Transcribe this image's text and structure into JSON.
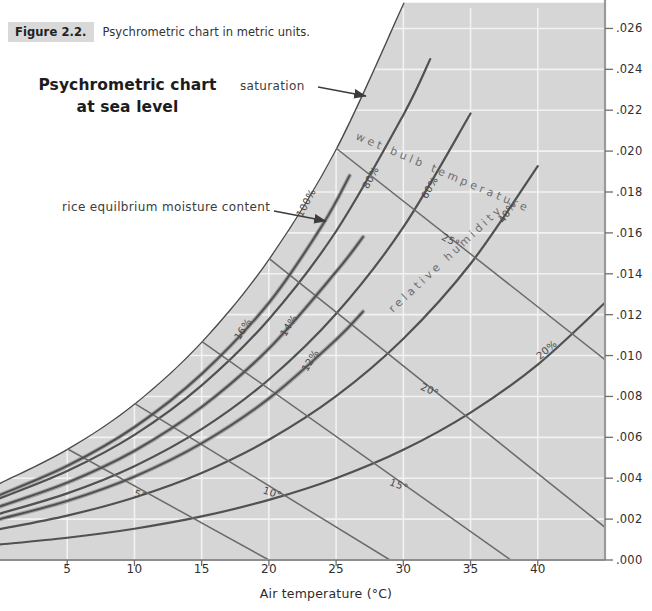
{
  "caption": {
    "tag": "Figure 2.2.",
    "text": "Psychrometric chart in metric units."
  },
  "title": {
    "line1": "Psychrometric chart",
    "line2": "at sea level"
  },
  "annotations": {
    "saturation": "saturation",
    "emc": "rice equilbrium moisture content",
    "wet_bulb_inline": "wet bulb temperature",
    "relative_humidity_inline": "relative humidity"
  },
  "colors": {
    "plot_fill": "#d6d6d6",
    "grid": "#f2f2f2",
    "curve": "#4a4a4a",
    "emc_curve": "#6f6f6f",
    "axis": "#9a9a9a",
    "caption_tag_bg": "#d9d9d9",
    "text": "#3a3a3a"
  },
  "chart_data": {
    "type": "line",
    "title": "Psychrometric chart at sea level",
    "xlabel": "Air temperature (°C)",
    "ylabel": "",
    "xlim": [
      0,
      45
    ],
    "ylim": [
      0.0,
      0.027
    ],
    "grid": true,
    "legend": "none",
    "xticks": [
      5,
      10,
      15,
      20,
      25,
      30,
      35,
      40
    ],
    "xtick_labels": [
      "5",
      "10",
      "15",
      "20",
      "25",
      "30",
      "35",
      "40"
    ],
    "yticks": [
      0.0,
      0.002,
      0.004,
      0.006,
      0.008,
      0.01,
      0.012,
      0.014,
      0.016,
      0.018,
      0.02,
      0.022,
      0.024,
      0.026
    ],
    "ytick_labels": [
      ".000",
      ".002",
      ".004",
      ".006",
      ".008",
      ".010",
      ".012",
      ".014",
      ".016",
      ".018",
      ".020",
      ".022",
      ".024",
      ".026"
    ],
    "series": [
      {
        "name": "100%",
        "kind": "relative-humidity",
        "label": "100%",
        "x": [
          0,
          5,
          10,
          15,
          20,
          25,
          30
        ],
        "values": [
          0.00378,
          0.00544,
          0.00766,
          0.01069,
          0.01475,
          0.02014,
          0.02726
        ]
      },
      {
        "name": "80%",
        "kind": "relative-humidity",
        "label": "80%",
        "x": [
          0,
          5,
          10,
          15,
          20,
          25,
          30,
          32
        ],
        "values": [
          0.00302,
          0.00435,
          0.00612,
          0.00854,
          0.01178,
          0.01608,
          0.02177,
          0.0245
        ]
      },
      {
        "name": "60%",
        "kind": "relative-humidity",
        "label": "60%",
        "x": [
          0,
          5,
          10,
          15,
          20,
          25,
          30,
          35
        ],
        "values": [
          0.00227,
          0.00326,
          0.00459,
          0.0064,
          0.00883,
          0.01204,
          0.01628,
          0.02184
        ]
      },
      {
        "name": "40%",
        "kind": "relative-humidity",
        "label": "40%",
        "x": [
          0,
          5,
          10,
          15,
          20,
          25,
          30,
          35,
          40
        ],
        "values": [
          0.00151,
          0.00217,
          0.00306,
          0.00426,
          0.00588,
          0.00801,
          0.01082,
          0.01449,
          0.01927
        ]
      },
      {
        "name": "20%",
        "kind": "relative-humidity",
        "label": "20%",
        "x": [
          0,
          5,
          10,
          15,
          20,
          25,
          30,
          35,
          40,
          45
        ],
        "values": [
          0.00076,
          0.00109,
          0.00153,
          0.00213,
          0.00294,
          0.004,
          0.00539,
          0.00721,
          0.00956,
          0.01258
        ]
      },
      {
        "name": "5°",
        "kind": "wet-bulb",
        "label": "5°",
        "x": [
          5,
          20
        ],
        "values": [
          0.00544,
          0.0
        ]
      },
      {
        "name": "10°",
        "kind": "wet-bulb",
        "label": "10°",
        "x": [
          10,
          29
        ],
        "values": [
          0.00766,
          0.0
        ]
      },
      {
        "name": "15°",
        "kind": "wet-bulb",
        "label": "15°",
        "x": [
          15,
          38
        ],
        "values": [
          0.01069,
          0.0
        ]
      },
      {
        "name": "20°",
        "kind": "wet-bulb",
        "label": "20°",
        "x": [
          20,
          45
        ],
        "values": [
          0.01475,
          0.0016
        ]
      },
      {
        "name": "25°",
        "kind": "wet-bulb",
        "label": "25°",
        "x": [
          25,
          45
        ],
        "values": [
          0.02014,
          0.0098
        ]
      },
      {
        "name": "16%",
        "kind": "rice-emc",
        "label": "16%",
        "x": [
          0,
          5,
          10,
          15,
          20,
          24,
          26
        ],
        "values": [
          0.00318,
          0.0046,
          0.0065,
          0.0091,
          0.01258,
          0.0164,
          0.0188
        ]
      },
      {
        "name": "14%",
        "kind": "rice-emc",
        "label": "14%",
        "x": [
          0,
          5,
          10,
          15,
          20,
          25,
          27
        ],
        "values": [
          0.00262,
          0.00378,
          0.00534,
          0.00748,
          0.01034,
          0.0141,
          0.0158
        ]
      },
      {
        "name": "12%",
        "kind": "rice-emc",
        "label": "12%",
        "x": [
          0,
          5,
          10,
          15,
          20,
          25,
          27
        ],
        "values": [
          0.002,
          0.00289,
          0.00408,
          0.00571,
          0.0079,
          0.01078,
          0.01215
        ]
      }
    ]
  }
}
